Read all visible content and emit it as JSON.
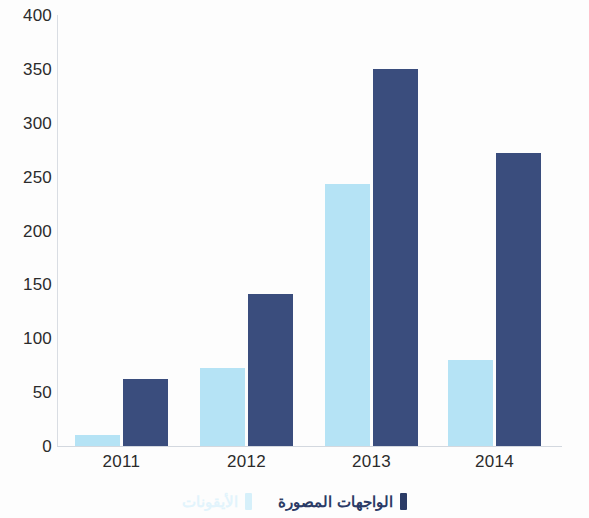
{
  "chart_data": {
    "type": "bar",
    "title": "",
    "subtitle": "",
    "xlabel": "",
    "ylabel": "",
    "categories": [
      "2011",
      "2012",
      "2013",
      "2014"
    ],
    "series": [
      {
        "name": "الأيقونات",
        "color": "#b5e3f5",
        "values": [
          10,
          72,
          243,
          80
        ]
      },
      {
        "name": "الواجهات المصورة",
        "color": "#3a4d7d",
        "values": [
          62,
          141,
          350,
          272
        ]
      }
    ],
    "ylim": [
      0,
      400
    ],
    "yticks": [
      0,
      50,
      100,
      150,
      200,
      250,
      300,
      350,
      400
    ],
    "ytick_labels": [
      "0",
      "50",
      "100",
      "150",
      "200",
      "250",
      "300",
      "350",
      "400"
    ],
    "grid": false,
    "legend_position": "bottom",
    "direction": "rtl"
  },
  "colors": {
    "light_series": "#b5e3f5",
    "dark_series": "#3a4d7d",
    "legend_light_text": "#e2f4fc",
    "legend_dark_text": "#2b3b66",
    "axis": "#d3d8df",
    "tick_text": "#2b2b2b",
    "background": "#fdfdfd"
  }
}
